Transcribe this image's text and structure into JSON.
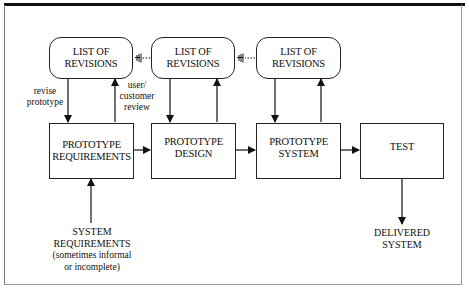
{
  "diagram": {
    "revision_boxes": [
      {
        "line1": "LIST OF",
        "line2": "REVISIONS"
      },
      {
        "line1": "LIST OF",
        "line2": "REVISIONS"
      },
      {
        "line1": "LIST OF",
        "line2": "REVISIONS"
      }
    ],
    "stage_boxes": [
      {
        "line1": "PROTOTYPE",
        "line2": "REQUIREMENTS"
      },
      {
        "line1": "PROTOTYPE",
        "line2": "DESIGN"
      },
      {
        "line1": "PROTOTYPE",
        "line2": "SYSTEM"
      },
      {
        "line1": "TEST",
        "line2": ""
      }
    ],
    "edge_labels": {
      "revise": {
        "line1": "revise",
        "line2": "prototype"
      },
      "review": {
        "line1": "user/",
        "line2": "customer",
        "line3": "review"
      }
    },
    "input": {
      "line1": "SYSTEM",
      "line2": "REQUIREMENTS",
      "line3": "(sometimes informal",
      "line4": "or incomplete)"
    },
    "output": {
      "line1": "DELIVERED",
      "line2": "SYSTEM"
    },
    "colors": {
      "line": "#111111",
      "background": "#ffffff",
      "frame": "#999999"
    }
  }
}
